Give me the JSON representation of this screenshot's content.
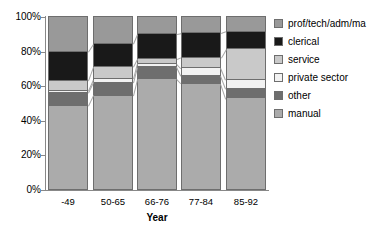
{
  "chart_data": {
    "type": "bar",
    "subtype": "stacked-100-percent-column",
    "title": "",
    "xlabel": "Year",
    "ylabel": "",
    "ylim": [
      0,
      100
    ],
    "yticks": [
      "0%",
      "20%",
      "40%",
      "60%",
      "80%",
      "100%"
    ],
    "ytick_values": [
      0,
      20,
      40,
      60,
      80,
      100
    ],
    "grid": false,
    "legend_position": "right",
    "categories": [
      "-49",
      "50-65",
      "66-76",
      "77-84",
      "85-92"
    ],
    "series": [
      {
        "name": "manual",
        "color": "#ababab",
        "values": [
          48.5,
          54.5,
          64.0,
          61.5,
          53.0
        ]
      },
      {
        "name": "other",
        "color": "#6e6e6e",
        "values": [
          7.5,
          7.5,
          7.0,
          4.5,
          5.5
        ]
      },
      {
        "name": "private sector",
        "color": "#f2f2f2",
        "values": [
          1.5,
          2.0,
          2.0,
          4.5,
          5.0
        ]
      },
      {
        "name": "service",
        "color": "#c9c9c9",
        "values": [
          5.5,
          7.0,
          2.5,
          6.0,
          18.0
        ]
      },
      {
        "name": "clerical",
        "color": "#191919",
        "values": [
          17.0,
          13.5,
          14.5,
          14.0,
          10.0
        ]
      },
      {
        "name": "prof/tech/adm/ma",
        "color": "#999999",
        "values": [
          20.0,
          15.5,
          10.0,
          9.5,
          8.5
        ]
      }
    ],
    "legend_entries": [
      {
        "label": "prof/tech/adm/ma",
        "color": "#999999"
      },
      {
        "label": "clerical",
        "color": "#191919"
      },
      {
        "label": "service",
        "color": "#c9c9c9"
      },
      {
        "label": "private sector",
        "color": "#f2f2f2"
      },
      {
        "label": "other",
        "color": "#6e6e6e"
      },
      {
        "label": "manual",
        "color": "#ababab"
      }
    ]
  },
  "axes": {
    "y_labels": [
      "100%",
      "80%",
      "60%",
      "40%",
      "20%",
      "0%"
    ],
    "x_title": "Year"
  },
  "colors": {
    "axis": "#888888",
    "segment_border": "#6e6e6e",
    "connector": "#a6a6a6",
    "background": "#ffffff",
    "text": "#000000"
  }
}
